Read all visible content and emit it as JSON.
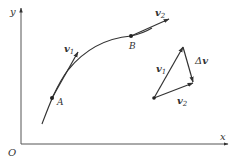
{
  "diagram": {
    "axes": {
      "x_label": "x",
      "y_label": "y",
      "origin_label": "O"
    },
    "points": {
      "A": "A",
      "B": "B"
    },
    "vectors": {
      "v1_at_A": {
        "symbol": "v",
        "sub": "1"
      },
      "v2_at_B": {
        "symbol": "v",
        "sub": "2"
      }
    },
    "triangle": {
      "v1": {
        "symbol": "v",
        "sub": "1"
      },
      "v2": {
        "symbol": "v",
        "sub": "2"
      },
      "dv": {
        "delta": "Δ",
        "symbol": "v"
      }
    },
    "colors": {
      "line": "#333333",
      "axis": "#555555",
      "background": "#ffffff"
    }
  }
}
